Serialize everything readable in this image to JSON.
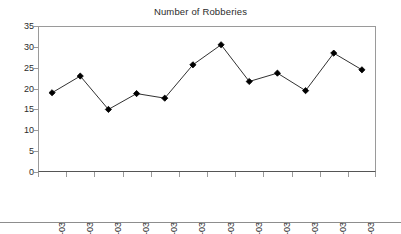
{
  "chart_data": {
    "type": "line",
    "title": "Number of Robberies",
    "xlabel": "",
    "ylabel": "",
    "categories": [
      "Jan-03",
      "Feb-03",
      "Mar-03",
      "Apr-03",
      "May-03",
      "Jun-03",
      "Jul-03",
      "Aug-03",
      "Sep-03",
      "Oct-03",
      "Nov-03",
      "Dec-03"
    ],
    "values": [
      19,
      23,
      15,
      18.8,
      17.7,
      25.7,
      30.5,
      21.7,
      23.7,
      19.5,
      28.5,
      24.5
    ],
    "series": [
      {
        "name": "Number of Robberies",
        "values": [
          19,
          23,
          15,
          18.8,
          17.7,
          25.7,
          30.5,
          21.7,
          23.7,
          19.5,
          28.5,
          24.5
        ]
      }
    ],
    "ylim": [
      0,
      35
    ],
    "y_ticks": [
      0,
      5,
      10,
      15,
      20,
      25,
      30,
      35
    ],
    "y_tick_labels": [
      "0",
      "5",
      "10",
      "15",
      "20",
      "25",
      "30",
      "35"
    ],
    "x_tick_labels": [
      "Jan-03",
      "Feb-03",
      "Mar-03",
      "Apr-03",
      "May-03",
      "Jun-03",
      "Jul-03",
      "Aug-03",
      "Sep-03",
      "Oct-03",
      "Nov-03",
      "Dec-03"
    ],
    "grid": false,
    "legend": false,
    "legend_position": "none",
    "marker": "diamond",
    "line_color": "#1a1a1a",
    "marker_color": "#000000",
    "axis_color": "#9a9a9a",
    "background_color": "#ffffff",
    "x_label_rotation": 90
  }
}
